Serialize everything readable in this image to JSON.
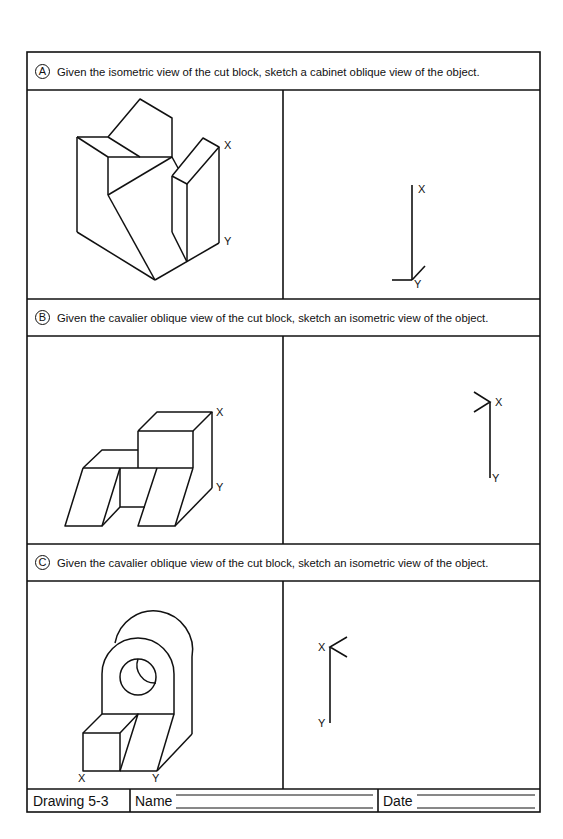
{
  "worksheet": {
    "sections": [
      {
        "id": "A",
        "badge": "A",
        "instruction": "Given the isometric view of the cut block, sketch a cabinet oblique view of the object.",
        "given_view": "isometric",
        "target_view": "cabinet oblique",
        "left_labels": {
          "x": "X",
          "y": "Y"
        },
        "right_labels": {
          "x": "X",
          "y": "Y"
        }
      },
      {
        "id": "B",
        "badge": "B",
        "instruction": "Given the cavalier oblique view of the cut block, sketch an isometric view of the object.",
        "given_view": "cavalier oblique",
        "target_view": "isometric",
        "left_labels": {
          "x": "X",
          "y": "Y"
        },
        "right_labels": {
          "x": "X",
          "y": "Y"
        }
      },
      {
        "id": "C",
        "badge": "C",
        "instruction": "Given the cavalier oblique view of the cut block, sketch an isometric view of the object.",
        "given_view": "cavalier oblique",
        "target_view": "isometric",
        "left_labels": {
          "x": "X",
          "y": "Y"
        },
        "right_labels": {
          "x": "X",
          "y": "Y"
        }
      }
    ],
    "footer": {
      "drawing_number": "Drawing 5-3",
      "name_label": "Name",
      "name_value": "",
      "date_label": "Date",
      "date_value": ""
    },
    "colors": {
      "line": "#111111",
      "paper": "#ffffff"
    }
  }
}
